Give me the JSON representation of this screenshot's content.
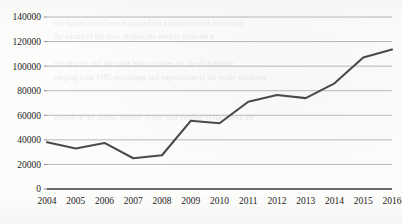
{
  "chart_data": {
    "type": "line",
    "title": "",
    "subtitle": "",
    "xlabel": "",
    "ylabel": "",
    "categories": [
      "2004",
      "2005",
      "2006",
      "2007",
      "2008",
      "2009",
      "2010",
      "2011",
      "2012",
      "2013",
      "2014",
      "2015",
      "2016"
    ],
    "series": [
      {
        "name": "",
        "values": [
          38000,
          33000,
          37500,
          25000,
          27500,
          55500,
          53500,
          71000,
          76500,
          74000,
          86000,
          107000,
          113500
        ]
      }
    ],
    "ylim": [
      0,
      140000
    ],
    "xlim_categories": [
      "2004",
      "2016"
    ],
    "y_ticks": [
      0,
      20000,
      40000,
      60000,
      80000,
      100000,
      120000,
      140000
    ],
    "y_tick_labels": [
      "0",
      "20000",
      "40000",
      "60000",
      "80000",
      "100000",
      "120000",
      "140000"
    ],
    "x_tick_labels": [
      "2004",
      "2005",
      "2006",
      "2007",
      "2008",
      "2009",
      "2010",
      "2011",
      "2012",
      "2013",
      "2014",
      "2015",
      "2016"
    ],
    "grid": true,
    "grid_axis": "y",
    "legend": false,
    "legend_position": "none",
    "line_color": "#4a4a4a",
    "grid_color": "#9a9a9a",
    "axis_color": "#3a3a3a",
    "background_color": "#fcfcfa",
    "annotations": []
  },
  "page": {
    "ghost_text": "                                                                                \n        the figures have been estimated for a population of more than\n        the nature of the data, despite the need to generate a\n                                                                                \n        the data set and the same basis - values for the distribution\n        ranging from 1995 percentage and approximately the wider estimates\n                                                                                \n                                                                                \n        growth in the annual number of the total number of the above are"
  }
}
